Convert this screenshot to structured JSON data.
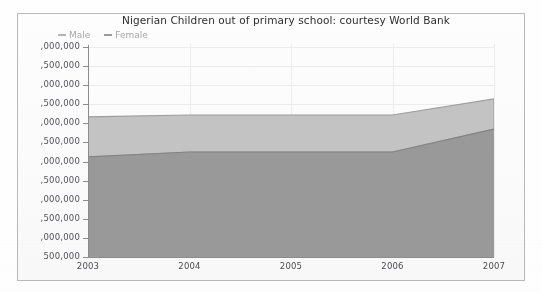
{
  "chart_data": {
    "type": "area",
    "stacked": true,
    "title": "Nigerian Children out of primary school: courtesy World Bank",
    "xlabel": "",
    "ylabel": "",
    "categories": [
      "2003",
      "2004",
      "2005",
      "2006",
      "2007"
    ],
    "series": [
      {
        "name": "Male",
        "color": "#9a9a9a",
        "values": [
          3120000,
          3250000,
          3250000,
          3250000,
          3850000
        ]
      },
      {
        "name": "Female",
        "color": "#c4c4c4",
        "values": [
          1050000,
          970000,
          970000,
          970000,
          790000
        ]
      }
    ],
    "stacked_totals": [
      4170000,
      4220000,
      4220000,
      4220000,
      4640000
    ],
    "ylim": [
      500000,
      6000000
    ],
    "ytick_step": 500000,
    "ytick_values": [
      6000000,
      5500000,
      5000000,
      4500000,
      4000000,
      3500000,
      3000000,
      2500000,
      2000000,
      1500000,
      1000000,
      500000
    ],
    "ytick_labels": [
      ",000,000",
      ",500,000",
      ",000,000",
      ",500,000",
      ",000,000",
      ",500,000",
      ",000,000",
      ",500,000",
      ",000,000",
      ",500,000",
      ",000,000",
      "500,000"
    ],
    "ytick_labels_note": "Y-axis tick labels are clipped at the left edge of the screenshot; leading million digits are not visible.",
    "xtick_labels": [
      "2003",
      "2004",
      "2005",
      "2006",
      "2007"
    ],
    "grid": true,
    "grid_color": "#ededed",
    "legend_position": "top-left",
    "legend": [
      {
        "label": "Male",
        "marker": "dash",
        "color": "#b4b4b4"
      },
      {
        "label": "Female",
        "marker": "dash",
        "color": "#9c9c9c"
      }
    ],
    "axis_color": "#8d8d8d",
    "frame_color": "#b9b9b9",
    "background": "#ffffff"
  }
}
